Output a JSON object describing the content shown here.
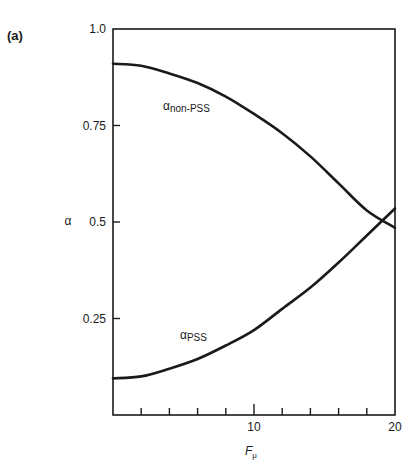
{
  "panel_label": "(a)",
  "chart_data": {
    "type": "line",
    "title": "",
    "xlabel": "F",
    "xlabel_subscript": "μ",
    "ylabel": "α",
    "xlim": [
      0,
      20
    ],
    "ylim": [
      0,
      1.0
    ],
    "x_ticks": [
      2,
      4,
      6,
      8,
      10,
      12,
      14,
      16,
      18,
      20
    ],
    "x_tick_labels": [
      {
        "value": 10,
        "label": "10"
      },
      {
        "value": 20,
        "label": "20"
      }
    ],
    "y_ticks": [
      {
        "value": 1.0,
        "label": "1.0"
      },
      {
        "value": 0.75,
        "label": "0.75"
      },
      {
        "value": 0.5,
        "label": "0.5"
      },
      {
        "value": 0.25,
        "label": "0.25"
      }
    ],
    "grid": false,
    "legend": "none (inline curve labels)",
    "x": [
      0,
      2,
      4,
      6,
      8,
      10,
      12,
      14,
      16,
      18,
      20
    ],
    "series": [
      {
        "name": "α_non-PSS",
        "label_main": "α",
        "label_sub": "non-PSS",
        "values": [
          0.91,
          0.905,
          0.885,
          0.86,
          0.825,
          0.78,
          0.73,
          0.67,
          0.6,
          0.53,
          0.485
        ]
      },
      {
        "name": "α_PSS",
        "label_main": "α",
        "label_sub": "PSS",
        "values": [
          0.095,
          0.1,
          0.12,
          0.145,
          0.18,
          0.22,
          0.275,
          0.33,
          0.395,
          0.465,
          0.535
        ]
      }
    ]
  }
}
